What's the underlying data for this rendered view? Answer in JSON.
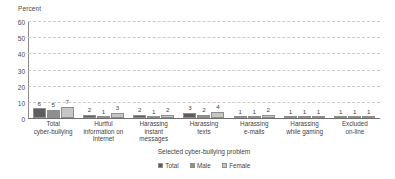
{
  "chart_data": {
    "type": "bar",
    "title": "",
    "subtitle": "",
    "xlabel": "Selected cyber-bullying problem",
    "ylabel": "Percent",
    "ylim": [
      0,
      60
    ],
    "ytick_labels": [
      "60",
      "50",
      "40",
      "30",
      "20",
      "10",
      "0"
    ],
    "yticks": [
      60,
      50,
      40,
      30,
      20,
      10,
      0
    ],
    "grid": true,
    "grid_style": "dashed-horizontal",
    "legend_position": "bottom-center",
    "categories": [
      "Total cyber-bullying",
      "Hurtful information on Internet",
      "Harassing instant messages",
      "Harassing texts",
      "Harassing e-mails",
      "Harassing while gaming",
      "Excluded on-line"
    ],
    "category_lines": [
      [
        "Total",
        "cyber-bullying"
      ],
      [
        "Hurtful",
        "information on",
        "Internet"
      ],
      [
        "Harassing",
        "instant",
        "messages"
      ],
      [
        "Harassing",
        "texts"
      ],
      [
        "Harassing",
        "e-mails"
      ],
      [
        "Harassing",
        "while gaming"
      ],
      [
        "Excluded",
        "on-line"
      ]
    ],
    "series": [
      {
        "name": "Total",
        "color": "#5e5e5e",
        "values": [
          6,
          2,
          2,
          3,
          1,
          1,
          1
        ]
      },
      {
        "name": "Male",
        "color": "#8f8f8f",
        "values": [
          5,
          1,
          1,
          2,
          1,
          1,
          1
        ]
      },
      {
        "name": "Female",
        "color": "#c6c6c6",
        "values": [
          7,
          3,
          2,
          4,
          2,
          1,
          1
        ]
      }
    ]
  },
  "legend": {
    "items": [
      {
        "label": "Total",
        "color": "#5e5e5e"
      },
      {
        "label": "Male",
        "color": "#8f8f8f"
      },
      {
        "label": "Female",
        "color": "#c6c6c6"
      }
    ]
  },
  "colors": {
    "total": "#5e5e5e",
    "male": "#8f8f8f",
    "female": "#c6c6c6",
    "gridline": "#c9c9c9",
    "axis": "#8a8a8a",
    "text": "#3f3f3f",
    "background": "#ffffff"
  }
}
